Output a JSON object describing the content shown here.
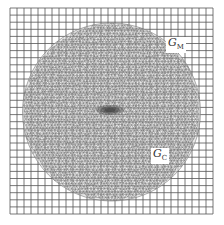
{
  "figure": {
    "background": "#ffffff",
    "grid": {
      "x0": 10,
      "y0": 8,
      "x1": 213,
      "y1": 214,
      "cells": 29,
      "color": "#555555"
    },
    "circle": {
      "cx": 111.5,
      "cy": 112,
      "r": 89,
      "mesh_color": "#666666",
      "density_center": {
        "cx": 110,
        "cy": 110,
        "rx": 14,
        "ry": 5
      }
    },
    "labels": {
      "coarse": {
        "main": "G",
        "sub": "M",
        "x": 166,
        "y": 37
      },
      "fine": {
        "main": "G",
        "sub": "C",
        "x": 151,
        "y": 148
      }
    }
  }
}
